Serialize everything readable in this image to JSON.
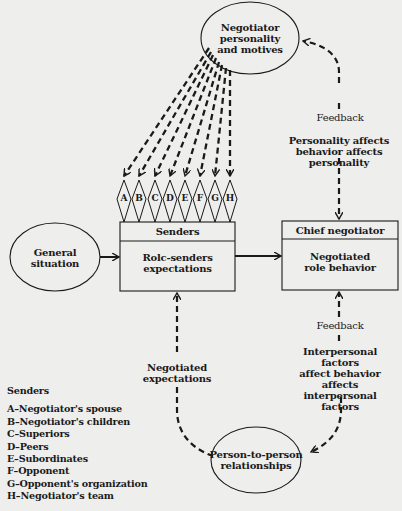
{
  "nodes": {
    "personality": {
      "lines": [
        "Negotiator",
        "personality",
        "and motives"
      ]
    },
    "general_situation": {
      "lines": [
        "General",
        "situation"
      ]
    },
    "senders_box": {
      "header": "Senders",
      "body_lines": [
        "Rolc-senders",
        "expectations"
      ]
    },
    "chief_box": {
      "header": "Chief negotiator",
      "body_lines": [
        "Negotiated",
        "role behavior"
      ]
    },
    "relationships": {
      "lines": [
        "Person-to-person",
        "relationships"
      ]
    }
  },
  "sender_codes": [
    "A",
    "B",
    "C",
    "D",
    "E",
    "F",
    "G",
    "H"
  ],
  "edge_labels": {
    "top_feedback": "Feedback",
    "top_note": [
      "Personality affects",
      "behavior affects",
      "personality"
    ],
    "bottom_feedback": "Feedback",
    "bottom_note": [
      "Interpersonal factors",
      "affect behavior affects",
      "interpersonal",
      "factors"
    ],
    "negotiated_expectations": [
      "Negotiated",
      "expectations"
    ]
  },
  "legend": {
    "title": "Senders",
    "items": [
      "A–Negotiator's spouse",
      "B–Negotiator's children",
      "C–Superiors",
      "D–Peers",
      "E–Subordinates",
      "F–Opponent",
      "G–Opponent's organization",
      "H–Negotiator's team"
    ]
  }
}
